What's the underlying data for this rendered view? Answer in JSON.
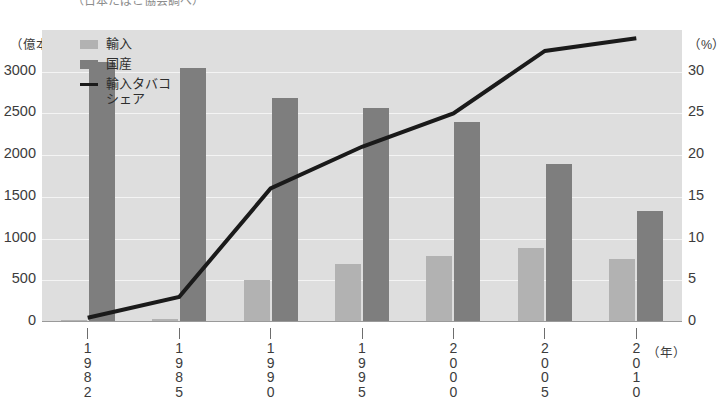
{
  "title": {
    "text": "（日本たばこ協会調べ）"
  },
  "axes": {
    "left_unit": "（億本）",
    "right_unit": "（%）",
    "left_ticks": [
      "3000",
      "2500",
      "2000",
      "1500",
      "1000",
      "500",
      "0"
    ],
    "right_ticks": [
      "30",
      "25",
      "20",
      "15",
      "10",
      "5",
      "0"
    ],
    "x_unit": "（年）"
  },
  "legend": {
    "items": [
      {
        "label": "輸入",
        "swatch": "import",
        "color": "#b2b2b2"
      },
      {
        "label": "国産",
        "swatch": "domestic",
        "color": "#7e7e7e"
      },
      {
        "label": "輸入タバコ\nシェア",
        "swatch": "line",
        "color": "#1a1a1a"
      }
    ]
  },
  "chart_data": {
    "type": "bar",
    "title": "（日本たばこ協会調べ）",
    "xlabel": "（年）",
    "ylabel": "（億本）",
    "y2label": "（%）",
    "ylim": [
      0,
      3500
    ],
    "y2lim": [
      0,
      35
    ],
    "yticks": [
      0,
      500,
      1000,
      1500,
      2000,
      2500,
      3000
    ],
    "y2ticks": [
      0,
      5,
      10,
      15,
      20,
      25,
      30
    ],
    "grid": true,
    "legend_position": "top-left",
    "categories": [
      "1982",
      "1985",
      "1990",
      "1995",
      "2000",
      "2005",
      "2010"
    ],
    "series": [
      {
        "name": "輸入",
        "type": "bar",
        "axis": "left",
        "color": "#b2b2b2",
        "values": [
          30,
          40,
          500,
          700,
          790,
          890,
          760
        ]
      },
      {
        "name": "国産",
        "type": "bar",
        "axis": "left",
        "color": "#7e7e7e",
        "values": [
          3120,
          3050,
          2680,
          2570,
          2400,
          1900,
          1330
        ]
      },
      {
        "name": "輸入タバコシェア",
        "type": "line",
        "axis": "right",
        "color": "#1a1a1a",
        "values": [
          0.5,
          3.0,
          16.0,
          21.0,
          25.0,
          32.5,
          34.0
        ]
      }
    ]
  }
}
